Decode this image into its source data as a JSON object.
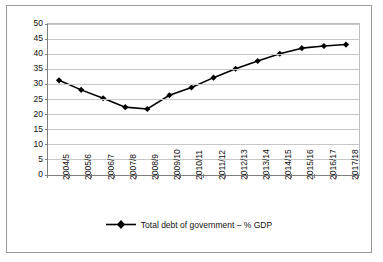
{
  "chart_data": {
    "type": "line",
    "title": "",
    "xlabel": "",
    "ylabel": "",
    "categories": [
      "2004/5",
      "2005/6",
      "2006/7",
      "2007/8",
      "2008/9",
      "2009/10",
      "2010/11",
      "2011/12",
      "2012/13",
      "2013/14",
      "2014/15",
      "2015/16",
      "2016/17",
      "2017/18"
    ],
    "series": [
      {
        "name": "Total debt of government – % GDP",
        "values": [
          31.1,
          27.9,
          25.1,
          22.1,
          21.5,
          26.1,
          28.7,
          32.0,
          35.0,
          37.6,
          40.0,
          41.9,
          42.6,
          43.1
        ],
        "color": "#000000",
        "marker": "diamond"
      }
    ],
    "ylim": [
      0,
      50
    ],
    "yticks": [
      0,
      5,
      10,
      15,
      20,
      25,
      30,
      35,
      40,
      45,
      50
    ],
    "ytick_labels": [
      "0",
      "5",
      "10",
      "15",
      "20",
      "25",
      "30",
      "35",
      "40",
      "45",
      "50"
    ],
    "grid": true,
    "grid_axis": "y",
    "grid_color": "#c8c8c8",
    "legend_position": "bottom",
    "plot_background": "#ffffff",
    "axis_color": "#7f7f7f"
  },
  "legend": {
    "entries": [
      {
        "label": "Total debt of government – % GDP",
        "color": "#000000"
      }
    ]
  }
}
